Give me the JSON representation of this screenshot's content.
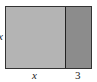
{
  "diagram": {
    "type": "area-model-rectangle",
    "regions": [
      {
        "name": "square",
        "width_label": "x",
        "height_label": "x",
        "color": "#b4b4b4"
      },
      {
        "name": "strip",
        "width_label": "3",
        "height_label": "x",
        "color": "#8c8c8c"
      }
    ],
    "labels": {
      "left": "x",
      "bottom_left": "x",
      "bottom_right": "3"
    },
    "border_color": "#333333"
  }
}
